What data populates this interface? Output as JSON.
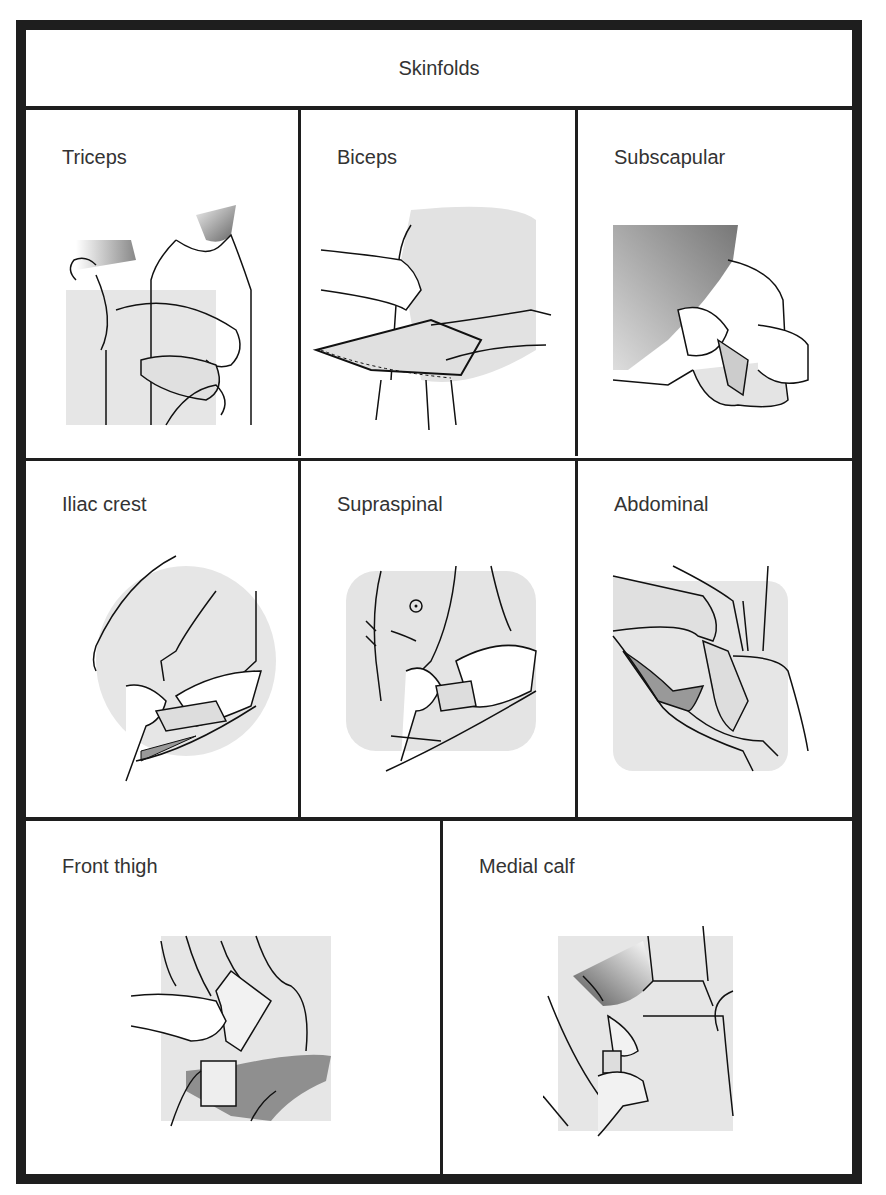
{
  "title": "Skinfolds",
  "panels": [
    {
      "label": "Triceps",
      "icon": "triceps-skinfold-illustration"
    },
    {
      "label": "Biceps",
      "icon": "biceps-skinfold-illustration"
    },
    {
      "label": "Subscapular",
      "icon": "subscapular-skinfold-illustration"
    },
    {
      "label": "Iliac crest",
      "icon": "iliac-crest-skinfold-illustration"
    },
    {
      "label": "Supraspinal",
      "icon": "supraspinal-skinfold-illustration"
    },
    {
      "label": "Abdominal",
      "icon": "abdominal-skinfold-illustration"
    },
    {
      "label": "Front thigh",
      "icon": "front-thigh-skinfold-illustration"
    },
    {
      "label": "Medial calf",
      "icon": "medial-calf-skinfold-illustration"
    }
  ],
  "colors": {
    "border": "#1e1e1e",
    "shade_light": "#e4e4e4",
    "shade_dark": "#8a8a8a",
    "line": "#111111"
  }
}
